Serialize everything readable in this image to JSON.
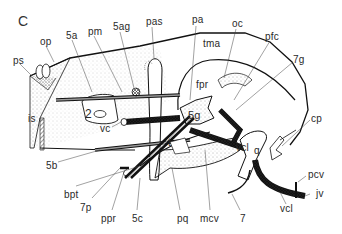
{
  "figure": {
    "panel_letter": "C",
    "labels": [
      {
        "id": "ps",
        "text": "ps",
        "x": 13,
        "y": 56
      },
      {
        "id": "op",
        "text": "op",
        "x": 40,
        "y": 37
      },
      {
        "id": "5a",
        "text": "5a",
        "x": 66,
        "y": 32
      },
      {
        "id": "pm",
        "text": "pm",
        "x": 88,
        "y": 28
      },
      {
        "id": "5ag",
        "text": "5ag",
        "x": 113,
        "y": 23
      },
      {
        "id": "pas",
        "text": "pas",
        "x": 146,
        "y": 18
      },
      {
        "id": "pa",
        "text": "pa",
        "x": 192,
        "y": 16
      },
      {
        "id": "tma",
        "text": "tma",
        "x": 203,
        "y": 40
      },
      {
        "id": "oc",
        "text": "oc",
        "x": 232,
        "y": 20
      },
      {
        "id": "pfc",
        "text": "pfc",
        "x": 265,
        "y": 32
      },
      {
        "id": "7g",
        "text": "7g",
        "x": 293,
        "y": 56
      },
      {
        "id": "fpr",
        "text": "fpr",
        "x": 196,
        "y": 82
      },
      {
        "id": "is",
        "text": "is",
        "x": 28,
        "y": 118
      },
      {
        "id": "2",
        "text": "2",
        "x": 85,
        "y": 110
      },
      {
        "id": "vc",
        "text": "vc",
        "x": 102,
        "y": 125
      },
      {
        "id": "5g",
        "text": "5g",
        "x": 192,
        "y": 112
      },
      {
        "id": "t",
        "text": "t",
        "x": 170,
        "y": 140
      },
      {
        "id": "vcl_upper",
        "text": "vcl",
        "x": 240,
        "y": 145
      },
      {
        "id": "q",
        "text": "q",
        "x": 257,
        "y": 148
      },
      {
        "id": "cp",
        "text": "cp",
        "x": 311,
        "y": 116
      },
      {
        "id": "5b",
        "text": "5b",
        "x": 46,
        "y": 162
      },
      {
        "id": "bpt",
        "text": "bpt",
        "x": 66,
        "y": 187
      },
      {
        "id": "7p",
        "text": "7p",
        "x": 82,
        "y": 199
      },
      {
        "id": "ppr",
        "text": "ppr",
        "x": 102,
        "y": 211
      },
      {
        "id": "5c",
        "text": "5c",
        "x": 131,
        "y": 211
      },
      {
        "id": "pq",
        "text": "pq",
        "x": 175,
        "y": 211
      },
      {
        "id": "mcv",
        "text": "mcv",
        "x": 201,
        "y": 211
      },
      {
        "id": "7",
        "text": "7",
        "x": 238,
        "y": 211
      },
      {
        "id": "pcv",
        "text": "pcv",
        "x": 307,
        "y": 172
      },
      {
        "id": "jv",
        "text": "jv",
        "x": 312,
        "y": 191
      },
      {
        "id": "vcl_lower",
        "text": "vcl",
        "x": 278,
        "y": 204
      }
    ]
  }
}
